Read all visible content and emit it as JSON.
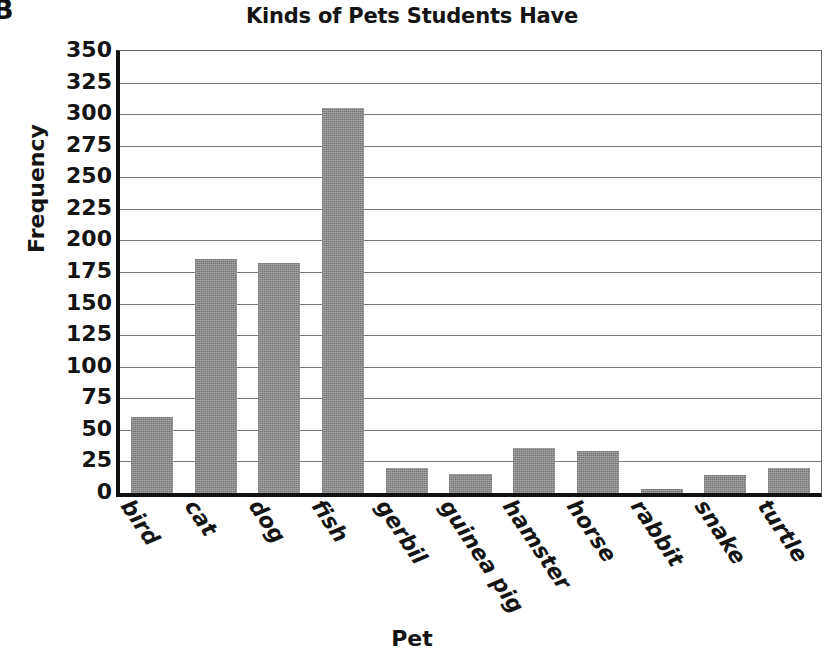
{
  "page": {
    "corner_letter": "B"
  },
  "chart_data": {
    "type": "bar",
    "title": "Kinds of Pets Students Have",
    "xlabel": "Pet",
    "ylabel": "Frequency",
    "categories": [
      "bird",
      "cat",
      "dog",
      "fish",
      "gerbil",
      "guinea pig",
      "hamster",
      "horse",
      "rabbit",
      "snake",
      "turtle"
    ],
    "values": [
      60,
      185,
      182,
      305,
      20,
      15,
      36,
      33,
      3,
      14,
      20
    ],
    "ylim": [
      0,
      350
    ],
    "ytick_step": 25,
    "yticks": [
      350,
      325,
      300,
      275,
      250,
      225,
      200,
      175,
      150,
      125,
      100,
      75,
      50,
      25,
      0
    ],
    "grid": true,
    "legend": "none",
    "bar_color": "#8a8a8a",
    "axis_color": "#111111",
    "gridline_color": "#7a7a7a",
    "text_color": "#141414"
  }
}
